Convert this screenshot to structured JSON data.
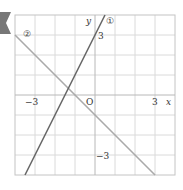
{
  "figure": {
    "type": "coordinate-plane",
    "x_range": [
      -4,
      4
    ],
    "y_range": [
      -4,
      4
    ],
    "grid_step": 1,
    "axis_labels": {
      "x": "x",
      "y": "y",
      "origin": "O"
    },
    "ticks": {
      "x_neg": "−3",
      "x_pos": "3",
      "y_pos": "3",
      "y_neg": "−3"
    },
    "lines": [
      {
        "label": "①",
        "equation": "y = 2x + 3",
        "slope": 2,
        "intercept": 3
      },
      {
        "label": "②",
        "equation": "y = -x - 1",
        "slope": -1,
        "intercept": -1
      }
    ],
    "colors": {
      "line1": "#6a6a6a",
      "line2": "#aaaaaa",
      "grid": "#d8d8d8",
      "axes": "#bbbbbb",
      "tab": "#777777"
    }
  }
}
